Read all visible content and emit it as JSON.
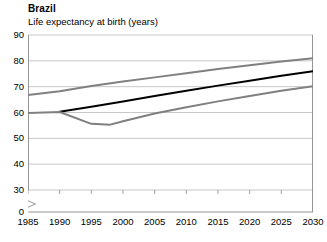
{
  "header": {
    "title": "Brazil",
    "subtitle": "Life expectancy at birth (years)"
  },
  "chart_data": {
    "type": "line",
    "title": "Brazil",
    "subtitle": "Life expectancy at birth (years)",
    "xlabel": "",
    "ylabel": "Life expectancy at birth (years)",
    "xlim": [
      1985,
      2030
    ],
    "ylim": [
      30,
      90
    ],
    "y_axis_break": true,
    "y_break_from": 0,
    "y_break_to": 30,
    "grid": "horizontal",
    "legend": "none",
    "yticks": [
      0,
      30,
      40,
      50,
      60,
      70,
      80,
      90
    ],
    "xticks": [
      1985,
      1990,
      1995,
      2000,
      2005,
      2010,
      2015,
      2020,
      2025,
      2030
    ],
    "x": [
      1985,
      1990,
      1995,
      2000,
      2005,
      2010,
      2015,
      2020,
      2025,
      2030
    ],
    "series": [
      {
        "name": "upper-series",
        "color": "#808080",
        "width": 2,
        "x": [
          1985,
          1990,
          1995,
          2000,
          2005,
          2010,
          2015,
          2020,
          2025,
          2030
        ],
        "values": [
          66.8,
          68.2,
          70.3,
          72.0,
          73.6,
          75.2,
          76.8,
          78.3,
          79.7,
          81.0
        ]
      },
      {
        "name": "middle-series",
        "color": "#000000",
        "width": 2,
        "x": [
          1990,
          1995,
          2000,
          2005,
          2010,
          2015,
          2020,
          2025,
          2030
        ],
        "values": [
          60.3,
          62.2,
          64.3,
          66.4,
          68.4,
          70.4,
          72.3,
          74.2,
          76.0
        ]
      },
      {
        "name": "lower-series",
        "color": "#808080",
        "width": 2,
        "x": [
          1985,
          1990,
          1995,
          1998,
          2000,
          2005,
          2010,
          2015,
          2020,
          2025,
          2030
        ],
        "values": [
          59.8,
          60.2,
          55.6,
          55.3,
          56.6,
          59.6,
          62.0,
          64.3,
          66.4,
          68.4,
          70.2
        ]
      }
    ]
  },
  "axis": {
    "ytick_labels": [
      "90",
      "80",
      "70",
      "60",
      "50",
      "40",
      "30",
      "0"
    ],
    "xtick_labels": [
      "1985",
      "1990",
      "1995",
      "2000",
      "2005",
      "2010",
      "2015",
      "2020",
      "2025",
      "2030"
    ]
  }
}
